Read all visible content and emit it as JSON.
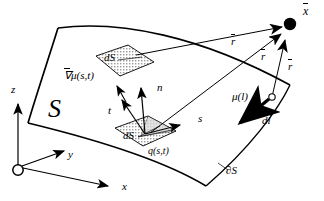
{
  "figure": {
    "kind": "surface-integral-geometry-diagram",
    "stroke_color": "#000000",
    "fill_hatch_color": "#b0b0b0",
    "background": "#ffffff"
  },
  "axes": {
    "origin_marker": "open-circle",
    "z_label": "z",
    "y_label": "y",
    "x_label": "x"
  },
  "surface": {
    "label": "S",
    "boundary_label": "∂S"
  },
  "patches": {
    "upper_label": "dS",
    "lower_label": "dS"
  },
  "vectors": {
    "normal_label": "n",
    "tangent_t_label": "t",
    "tangent_s_label": "s",
    "gradient_label": "μ(s,t)",
    "gradient_prefix": "∇",
    "source_label": "q(s,t)",
    "mu_line_label": "μ(l)",
    "dl_label": "dl",
    "field_point_label": "x",
    "r_label": "r",
    "r_count": 3
  },
  "field_point": {
    "marker": "filled-circle",
    "label": "x"
  }
}
